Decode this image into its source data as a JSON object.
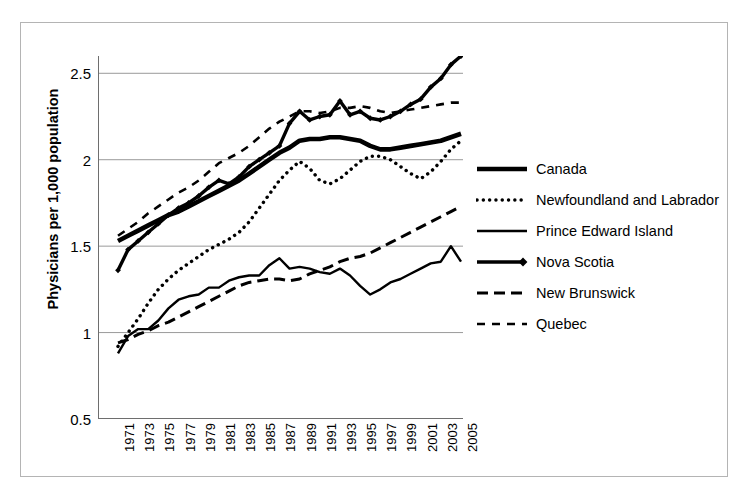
{
  "chart_data": {
    "type": "line",
    "title": "",
    "xlabel": "",
    "ylabel": "Physicians per 1,000 population",
    "xlim": [
      1971,
      2005
    ],
    "ylim": [
      0.5,
      2.6
    ],
    "grid": "horizontal",
    "legend_position": "right",
    "y_ticks": [
      "0.5",
      "1",
      "1.5",
      "2",
      "2.5"
    ],
    "y_tick_values": [
      0.5,
      1,
      1.5,
      2,
      2.5
    ],
    "x_ticks": [
      "1971",
      "1973",
      "1975",
      "1977",
      "1979",
      "1981",
      "1983",
      "1985",
      "1987",
      "1989",
      "1991",
      "1993",
      "1995",
      "1997",
      "1999",
      "2001",
      "2003",
      "2005"
    ],
    "x": [
      1971,
      1972,
      1973,
      1974,
      1975,
      1976,
      1977,
      1978,
      1979,
      1980,
      1981,
      1982,
      1983,
      1984,
      1985,
      1986,
      1987,
      1988,
      1989,
      1990,
      1991,
      1992,
      1993,
      1994,
      1995,
      1996,
      1997,
      1998,
      1999,
      2000,
      2001,
      2002,
      2003,
      2004,
      2005
    ],
    "series": [
      {
        "name": "Canada",
        "style": "thick-solid",
        "values": [
          1.53,
          1.56,
          1.59,
          1.62,
          1.65,
          1.68,
          1.7,
          1.73,
          1.76,
          1.79,
          1.82,
          1.85,
          1.88,
          1.92,
          1.96,
          2.0,
          2.04,
          2.07,
          2.11,
          2.12,
          2.12,
          2.13,
          2.13,
          2.12,
          2.11,
          2.08,
          2.06,
          2.06,
          2.07,
          2.08,
          2.09,
          2.1,
          2.11,
          2.13,
          2.15
        ]
      },
      {
        "name": "Newfoundland and Labrador",
        "style": "dotted",
        "values": [
          0.92,
          1.0,
          1.08,
          1.17,
          1.25,
          1.31,
          1.36,
          1.4,
          1.44,
          1.48,
          1.51,
          1.54,
          1.58,
          1.64,
          1.72,
          1.8,
          1.88,
          1.94,
          1.99,
          1.95,
          1.88,
          1.86,
          1.89,
          1.94,
          1.99,
          2.02,
          2.02,
          2.0,
          1.96,
          1.92,
          1.89,
          1.93,
          1.99,
          2.06,
          2.11
        ]
      },
      {
        "name": "Prince Edward Island",
        "style": "thin-solid",
        "values": [
          0.88,
          0.98,
          1.02,
          1.02,
          1.07,
          1.14,
          1.19,
          1.21,
          1.22,
          1.26,
          1.26,
          1.3,
          1.32,
          1.33,
          1.33,
          1.39,
          1.43,
          1.37,
          1.38,
          1.37,
          1.35,
          1.34,
          1.37,
          1.33,
          1.27,
          1.22,
          1.25,
          1.29,
          1.31,
          1.34,
          1.37,
          1.4,
          1.41,
          1.5,
          1.41
        ]
      },
      {
        "name": "Nova Scotia",
        "style": "thick-diamond",
        "values": [
          1.36,
          1.48,
          1.53,
          1.58,
          1.63,
          1.68,
          1.72,
          1.75,
          1.79,
          1.84,
          1.88,
          1.86,
          1.9,
          1.96,
          2.0,
          2.04,
          2.08,
          2.21,
          2.28,
          2.23,
          2.25,
          2.26,
          2.34,
          2.26,
          2.28,
          2.24,
          2.23,
          2.25,
          2.28,
          2.32,
          2.35,
          2.42,
          2.47,
          2.55,
          2.6
        ]
      },
      {
        "name": "New Brunswick",
        "style": "dashed",
        "values": [
          0.94,
          0.96,
          0.99,
          1.01,
          1.04,
          1.06,
          1.09,
          1.12,
          1.15,
          1.18,
          1.21,
          1.24,
          1.27,
          1.29,
          1.3,
          1.31,
          1.31,
          1.3,
          1.31,
          1.34,
          1.36,
          1.38,
          1.41,
          1.43,
          1.44,
          1.46,
          1.49,
          1.52,
          1.55,
          1.58,
          1.61,
          1.64,
          1.67,
          1.7,
          1.73
        ]
      },
      {
        "name": "Quebec",
        "style": "long-dash",
        "values": [
          1.56,
          1.6,
          1.64,
          1.69,
          1.73,
          1.77,
          1.81,
          1.84,
          1.88,
          1.93,
          1.98,
          2.01,
          2.04,
          2.08,
          2.13,
          2.18,
          2.22,
          2.25,
          2.28,
          2.28,
          2.27,
          2.28,
          2.3,
          2.3,
          2.31,
          2.3,
          2.28,
          2.27,
          2.28,
          2.29,
          2.3,
          2.31,
          2.32,
          2.33,
          2.33
        ]
      }
    ]
  },
  "axis": {
    "y_title": "Physicians per 1,000 population"
  },
  "legend": {
    "items": [
      {
        "label": "Canada",
        "style": "thick-solid"
      },
      {
        "label": "Newfoundland and Labrador",
        "style": "dotted"
      },
      {
        "label": "Prince Edward Island",
        "style": "thin-solid"
      },
      {
        "label": "Nova Scotia",
        "style": "thick-diamond"
      },
      {
        "label": "New Brunswick",
        "style": "dashed"
      },
      {
        "label": "Quebec",
        "style": "long-dash"
      }
    ]
  },
  "colors": {
    "ink": "#000000",
    "grid": "#9a9a9a",
    "axis": "#6e6e6e",
    "border": "#b4b4b4",
    "background": "#ffffff"
  }
}
